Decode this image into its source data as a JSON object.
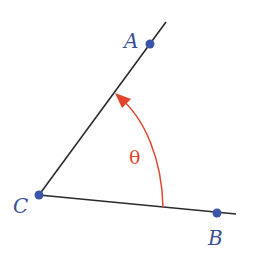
{
  "diagram": {
    "type": "angle",
    "points": {
      "A": {
        "label": "A",
        "x": 150,
        "y": 44
      },
      "B": {
        "label": "B",
        "x": 217,
        "y": 213
      },
      "C": {
        "label": "C",
        "x": 39,
        "y": 195
      }
    },
    "angle_label": "θ",
    "colors": {
      "line": "#2b2b2b",
      "point": "#3b56a8",
      "label": "#3a4f9a",
      "arc": "#e0452b"
    }
  }
}
